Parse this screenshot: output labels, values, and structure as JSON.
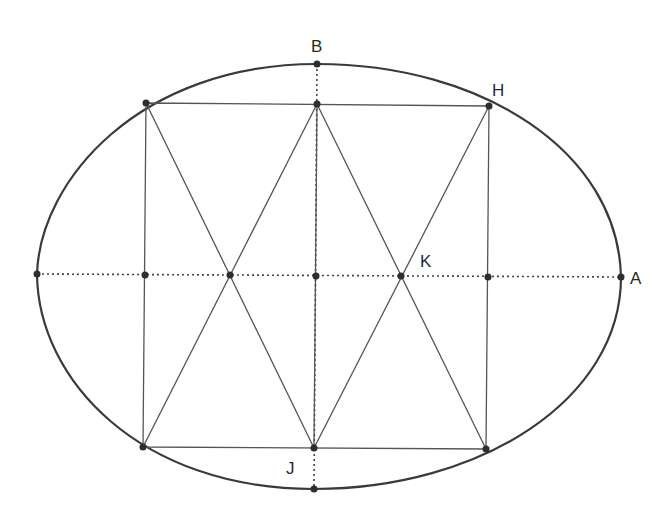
{
  "diagram": {
    "type": "geometric construction",
    "labels": {
      "B": "B",
      "H": "H",
      "K": "K",
      "A": "A",
      "J": "J"
    },
    "colors": {
      "curve": "#3a3a3a",
      "lines": "#555555",
      "points": "#2e2e2e",
      "background": "#ffffff"
    },
    "points": {
      "B": [
        317,
        64
      ],
      "top_mid": [
        317,
        104
      ],
      "top_left": [
        146,
        103
      ],
      "H": [
        489,
        106
      ],
      "left_end": [
        37,
        274
      ],
      "mid_left": [
        145,
        275
      ],
      "cross_left": [
        230,
        275
      ],
      "center": [
        316,
        276
      ],
      "K": [
        401,
        276
      ],
      "mid_right": [
        488,
        277
      ],
      "A": [
        621,
        277
      ],
      "bottom_left": [
        143,
        447
      ],
      "bottom_mid": [
        314,
        448
      ],
      "bottom_right": [
        486,
        449
      ],
      "bottom": [
        314,
        489
      ]
    }
  }
}
